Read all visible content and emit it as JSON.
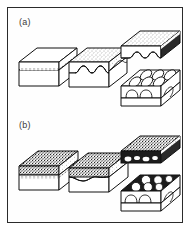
{
  "figure": {
    "caption_panels": [
      {
        "id": "a",
        "label": "(a)"
      },
      {
        "id": "b",
        "label": "(b)"
      }
    ],
    "border_color": "#2b2b2b",
    "background_color": "#ffffff",
    "ink_color": "#111111",
    "stipple_color": "#3a3a3a"
  },
  "panel_a": {
    "label": "(a)",
    "description": "Three-stage block diagram sequence: flat planar interface, scalloped interface, and detached slab revealing elongated oval domes.",
    "stages": [
      {
        "name": "stage-1",
        "interface": "planar",
        "top_layer_texture": "blank",
        "lower_layer_texture": "blank",
        "domes": 0,
        "dome_shape": "none",
        "detached": false
      },
      {
        "name": "stage-2",
        "interface": "scalloped",
        "top_layer_texture": "stipple-light",
        "lower_layer_texture": "blank",
        "domes": 3,
        "dome_shape": "arch",
        "detached": false
      },
      {
        "name": "stage-3-upper-slab",
        "interface": "scalloped-underside",
        "top_layer_texture": "stipple-light",
        "lower_layer_texture": "blank",
        "domes": 3,
        "dome_shape": "arch",
        "detached": true
      },
      {
        "name": "stage-3-lower-block",
        "interface": "domed",
        "top_layer_texture": "blank",
        "lower_layer_texture": "blank",
        "domes": 6,
        "dome_shape": "oval-elongated",
        "detached": true
      }
    ]
  },
  "panel_b": {
    "label": "(b)",
    "description": "Three-stage block diagram sequence with dense dark stippled upper layer: planar interface, slightly undulating interface, and detached slab revealing circular domes.",
    "stages": [
      {
        "name": "stage-1",
        "interface": "planar",
        "top_layer_texture": "stipple-dark",
        "lower_layer_texture": "blank",
        "domes": 0,
        "dome_shape": "none",
        "detached": false
      },
      {
        "name": "stage-2",
        "interface": "undulating",
        "top_layer_texture": "stipple-dark",
        "lower_layer_texture": "blank",
        "domes": 2,
        "dome_shape": "shallow-wave",
        "detached": false
      },
      {
        "name": "stage-3-upper-slab",
        "interface": "irregular-underside",
        "top_layer_texture": "stipple-dark",
        "lower_layer_texture": "blank",
        "domes": 4,
        "dome_shape": "irregular",
        "detached": true
      },
      {
        "name": "stage-3-lower-block",
        "interface": "domed",
        "top_layer_texture": "blank",
        "lower_layer_texture": "blank",
        "domes": 6,
        "dome_shape": "circular",
        "detached": true
      }
    ]
  }
}
